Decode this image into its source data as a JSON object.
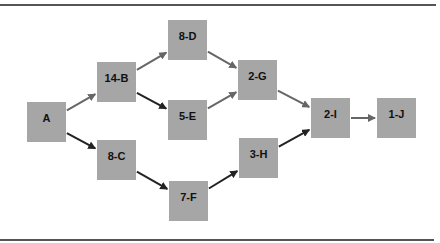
{
  "diagram": {
    "type": "network activity diagram",
    "node_color": "#a6a6a6",
    "edge_color_dark": "#222222",
    "edge_color_gray": "#666666",
    "nodes": [
      {
        "id": "A",
        "label": "A",
        "x": 27,
        "y": 102
      },
      {
        "id": "B",
        "label": "14-B",
        "x": 97,
        "y": 62
      },
      {
        "id": "C",
        "label": "8-C",
        "x": 97,
        "y": 140
      },
      {
        "id": "D",
        "label": "8-D",
        "x": 168,
        "y": 20
      },
      {
        "id": "E",
        "label": "5-E",
        "x": 168,
        "y": 100
      },
      {
        "id": "F",
        "label": "7-F",
        "x": 169,
        "y": 181
      },
      {
        "id": "G",
        "label": "2-G",
        "x": 238,
        "y": 60
      },
      {
        "id": "H",
        "label": "3-H",
        "x": 239,
        "y": 138
      },
      {
        "id": "I",
        "label": "2-I",
        "x": 311,
        "y": 98
      },
      {
        "id": "J",
        "label": "1-J",
        "x": 377,
        "y": 98
      }
    ],
    "edges": [
      {
        "from": "A",
        "to": "B",
        "shade": "gray"
      },
      {
        "from": "A",
        "to": "C",
        "shade": "dark"
      },
      {
        "from": "B",
        "to": "D",
        "shade": "gray"
      },
      {
        "from": "B",
        "to": "E",
        "shade": "dark"
      },
      {
        "from": "D",
        "to": "G",
        "shade": "gray"
      },
      {
        "from": "E",
        "to": "G",
        "shade": "gray"
      },
      {
        "from": "C",
        "to": "F",
        "shade": "dark"
      },
      {
        "from": "F",
        "to": "H",
        "shade": "dark"
      },
      {
        "from": "G",
        "to": "I",
        "shade": "gray"
      },
      {
        "from": "H",
        "to": "I",
        "shade": "dark"
      },
      {
        "from": "I",
        "to": "J",
        "shade": "gray"
      }
    ]
  }
}
